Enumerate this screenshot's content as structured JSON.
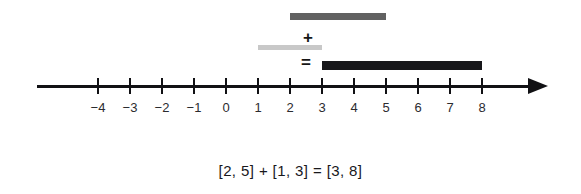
{
  "figure": {
    "caption": "[2, 5] + [1, 3] = [3, 8]"
  },
  "operators": {
    "plus": "+",
    "equals": "="
  },
  "axis": {
    "arrow_direction": "right",
    "tick_labels": [
      "−4",
      "−3",
      "−2",
      "−1",
      "0",
      "1",
      "2",
      "3",
      "4",
      "5",
      "6",
      "7",
      "8"
    ]
  },
  "chart_data": {
    "type": "bar",
    "title": "[2, 5] + [1, 3] = [3, 8]",
    "xlabel": "",
    "ylabel": "",
    "orientation": "horizontal",
    "xlim": [
      -4,
      8
    ],
    "grid": false,
    "legend": "none",
    "axis_ticks": [
      -4,
      -3,
      -2,
      -1,
      0,
      1,
      2,
      3,
      4,
      5,
      6,
      7,
      8
    ],
    "axis_tick_labels": [
      "−4",
      "−3",
      "−2",
      "−1",
      "0",
      "1",
      "2",
      "3",
      "4",
      "5",
      "6",
      "7",
      "8"
    ],
    "series": [
      {
        "name": "interval-a",
        "label": "[2, 5]",
        "start": 2,
        "end": 5,
        "color": "#616161",
        "row": 0
      },
      {
        "name": "interval-b",
        "label": "[1, 3]",
        "start": 1,
        "end": 3,
        "color": "#c8c8c8",
        "row": 1
      },
      {
        "name": "interval-sum",
        "label": "[3, 8]",
        "start": 3,
        "end": 8,
        "color": "#17171a",
        "row": 2
      }
    ],
    "annotations": [
      {
        "name": "plus-operator",
        "text": "+",
        "between": [
          "interval-a",
          "interval-b"
        ]
      },
      {
        "name": "equals-operator",
        "text": "=",
        "between": [
          "interval-b",
          "interval-sum"
        ]
      }
    ]
  },
  "colors": {
    "axis": "#111114",
    "bar_a": "#616161",
    "bar_b": "#c8c8c8",
    "bar_sum": "#17171a",
    "text": "#18181c",
    "background": "#ffffff"
  }
}
